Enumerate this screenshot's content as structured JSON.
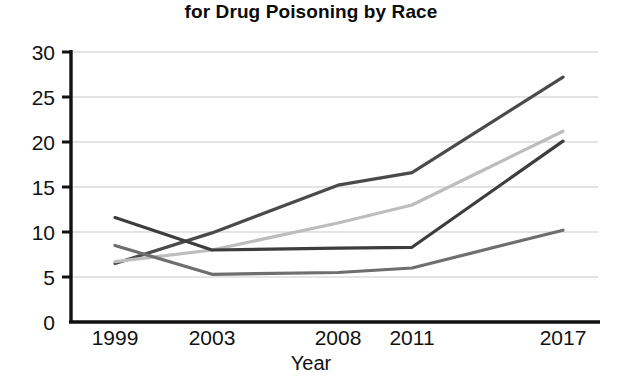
{
  "chart_data": {
    "type": "line",
    "title": "for Drug Poisoning by Race",
    "xlabel": "Year",
    "ylabel": "",
    "x": [
      1999,
      2003,
      2008,
      2011,
      2017
    ],
    "categories": [
      "1999",
      "2003",
      "2008",
      "2011",
      "2017"
    ],
    "xlim": [
      1999,
      2017
    ],
    "ylim": [
      0,
      30
    ],
    "yticks": [
      0,
      5,
      10,
      15,
      20,
      25,
      30
    ],
    "ytick_labels": [
      "0",
      "5",
      "10",
      "15",
      "20",
      "25",
      "30"
    ],
    "xtick_labels": [
      "1999",
      "2003",
      "2008",
      "2011",
      "2017"
    ],
    "grid": "horizontal",
    "legend": "none",
    "series": [
      {
        "name": "series-1",
        "color": "#4a4a4a",
        "width": 3.2,
        "values": [
          6.5,
          9.9,
          15.2,
          16.6,
          27.2
        ]
      },
      {
        "name": "series-2",
        "color": "#bdbdbd",
        "width": 3.2,
        "values": [
          6.7,
          8.0,
          11.0,
          13.0,
          21.2
        ]
      },
      {
        "name": "series-3",
        "color": "#3d3d3d",
        "width": 3.2,
        "values": [
          11.6,
          8.0,
          8.2,
          8.3,
          20.1
        ]
      },
      {
        "name": "series-4",
        "color": "#6e6e6e",
        "width": 3.2,
        "values": [
          8.5,
          5.3,
          5.5,
          6.0,
          10.2
        ]
      }
    ],
    "axis_color": "#111111",
    "grid_color": "#c9c9c9"
  },
  "axis": {
    "y_ticks": [
      "30",
      "25",
      "20",
      "15",
      "10",
      "5",
      "0"
    ],
    "x_ticks": [
      "1999",
      "2003",
      "2008",
      "2011",
      "2017"
    ],
    "x_title": "Year"
  }
}
